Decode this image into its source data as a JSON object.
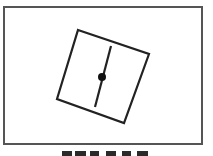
{
  "diagram": {
    "frame": {
      "x": 4,
      "y": 7,
      "width": 198,
      "height": 137,
      "stroke": "#555555",
      "stroke_width": 2
    },
    "rotated_square": {
      "points": [
        [
          78,
          30
        ],
        [
          149,
          54
        ],
        [
          124,
          123
        ],
        [
          57,
          99
        ]
      ],
      "stroke": "#222222",
      "stroke_width": 2.2
    },
    "needle_line": {
      "x1": 111,
      "y1": 46,
      "x2": 95,
      "y2": 107,
      "stroke": "#222222",
      "stroke_width": 2.2
    },
    "pivot_dot": {
      "cx": 102,
      "cy": 77,
      "r": 4,
      "fill": "#111111"
    }
  },
  "caption": {
    "visible": "partial",
    "note": ""
  }
}
